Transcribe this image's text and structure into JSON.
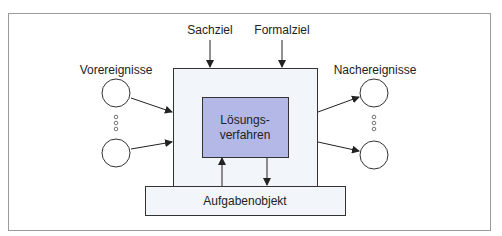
{
  "diagram": {
    "labels": {
      "sachziel": "Sachziel",
      "formalziel": "Formalziel",
      "vorereignisse": "Vorereignisse",
      "nachereignisse": "Nachereignisse",
      "loesung_line1": "Lösungs-",
      "loesung_line2": "verfahren",
      "aufgabenobjekt": "Aufgabenobjekt"
    },
    "colors": {
      "frame": "#9a9a9a",
      "system_fill": "#f2f5fa",
      "inner_fill": "#b3b8e6",
      "stroke": "#333333"
    }
  }
}
